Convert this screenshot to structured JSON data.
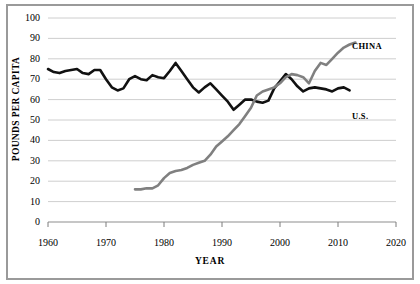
{
  "chart_data": {
    "type": "line",
    "title": "",
    "xlabel": "YEAR",
    "ylabel": "POUNDS PER CAPITA",
    "xlim": [
      1960,
      2020
    ],
    "ylim": [
      0,
      100
    ],
    "grid": true,
    "legend_position": "inline-right-end",
    "xticks": [
      "1960",
      "1970",
      "1980",
      "1990",
      "2000",
      "2010",
      "2020"
    ],
    "yticks": [
      "0",
      "10",
      "20",
      "30",
      "40",
      "50",
      "60",
      "70",
      "80",
      "90",
      "100"
    ],
    "series": [
      {
        "name": "U.S.",
        "color": "#111111",
        "x": [
          1960,
          1961,
          1962,
          1963,
          1964,
          1965,
          1966,
          1967,
          1968,
          1969,
          1970,
          1971,
          1972,
          1973,
          1974,
          1975,
          1976,
          1977,
          1978,
          1979,
          1980,
          1981,
          1982,
          1983,
          1984,
          1985,
          1986,
          1987,
          1988,
          1989,
          1990,
          1991,
          1992,
          1993,
          1994,
          1995,
          1996,
          1997,
          1998,
          1999,
          2000,
          2001,
          2002,
          2003,
          2004,
          2005,
          2006,
          2007,
          2008,
          2009,
          2010,
          2011,
          2012
        ],
        "values": [
          75,
          73.5,
          73,
          74,
          74.5,
          75,
          73,
          72.5,
          74.5,
          74.5,
          70,
          66,
          64.5,
          65.5,
          70,
          71.5,
          70,
          69.5,
          72,
          71,
          70.5,
          74,
          78,
          74,
          70,
          66,
          63.5,
          66,
          68,
          65,
          62,
          59,
          55,
          57.5,
          60,
          60,
          59,
          58.5,
          59.5,
          65.5,
          69,
          72.5,
          70,
          66.5,
          64,
          65.5,
          66,
          65.5,
          65,
          64,
          65.5,
          66,
          64.5
        ],
        "label_x": 2013,
        "label_y": 60
      },
      {
        "name": "CHINA",
        "color": "#808080",
        "x": [
          1975,
          1976,
          1977,
          1978,
          1979,
          1980,
          1981,
          1982,
          1983,
          1984,
          1985,
          1986,
          1987,
          1988,
          1989,
          1990,
          1991,
          1992,
          1993,
          1994,
          1995,
          1996,
          1997,
          1998,
          1999,
          2000,
          2001,
          2002,
          2003,
          2004,
          2005,
          2006,
          2007,
          2008,
          2009,
          2010,
          2011,
          2012,
          2013
        ],
        "values": [
          16,
          16,
          16.5,
          16.5,
          18,
          21.5,
          24,
          25,
          25.5,
          26.5,
          28,
          29,
          30,
          33,
          37,
          39.5,
          42,
          45,
          48,
          52,
          56,
          62,
          64,
          65,
          66,
          68,
          71,
          72.5,
          72,
          71,
          68,
          74,
          78,
          77,
          80,
          83,
          85.5,
          87,
          88
        ],
        "label_x": 2014,
        "label_y": 88
      }
    ]
  },
  "axis": {
    "y_title": "POUNDS PER CAPITA",
    "x_title": "YEAR"
  }
}
